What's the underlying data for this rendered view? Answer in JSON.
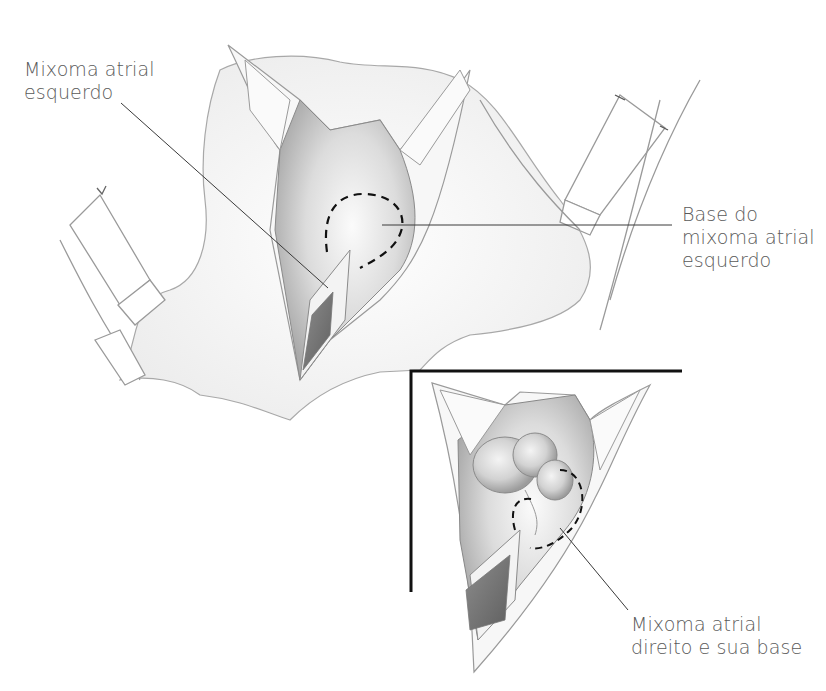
{
  "figure": {
    "type": "surgical-illustration",
    "colors": {
      "background": "#ffffff",
      "outline": "#9a9a9a",
      "shading_mid": "#c8c8c8",
      "shading_dark": "#6e6e6e",
      "leader_line": "#3a3a3a",
      "label_text": "#5a5a5a",
      "inset_frame": "#111111"
    }
  },
  "labels": {
    "left_atrial_myxoma": {
      "line1": "Mixoma atrial",
      "line2": "esquerdo"
    },
    "left_myxoma_base": {
      "line1": "Base do",
      "line2": "mixoma atrial",
      "line3": "esquerdo"
    },
    "right_atrial_myxoma": {
      "line1": "Mixoma atrial",
      "line2": "direito e sua base"
    }
  }
}
